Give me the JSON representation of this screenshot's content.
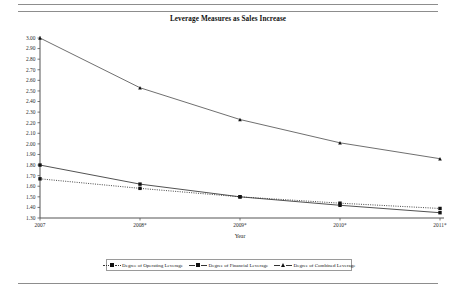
{
  "document": {
    "rules": [
      "top-rule-1",
      "top-rule-2",
      "bottom-rule"
    ]
  },
  "chart_data": {
    "type": "line",
    "title": "Leverage Measures as Sales Increase",
    "xlabel": "Year",
    "ylabel": "",
    "categories": [
      "2007",
      "2008*",
      "2009*",
      "2010*",
      "2011*"
    ],
    "ylim": [
      1.3,
      3.0
    ],
    "ytick_labels": [
      "3.00",
      "2.90",
      "2.80",
      "2.70",
      "2.60",
      "2.50",
      "2.40",
      "2.30",
      "2.20",
      "2.10",
      "2.00",
      "1.90",
      "1.80",
      "1.70",
      "1.60",
      "1.50",
      "1.40",
      "1.30"
    ],
    "ytick_values": [
      3.0,
      2.9,
      2.8,
      2.7,
      2.6,
      2.5,
      2.4,
      2.3,
      2.2,
      2.1,
      2.0,
      1.9,
      1.8,
      1.7,
      1.6,
      1.5,
      1.4,
      1.3
    ],
    "grid": false,
    "legend_position": "bottom",
    "series": [
      {
        "name": "Degree of Operating Leverage",
        "values": [
          1.67,
          1.58,
          1.5,
          1.44,
          1.39
        ],
        "line_style": "dotted",
        "marker": "square",
        "color": "#333333"
      },
      {
        "name": "Degree of Financial Leverage",
        "values": [
          1.8,
          1.62,
          1.5,
          1.42,
          1.35
        ],
        "line_style": "solid",
        "marker": "square",
        "color": "#333333"
      },
      {
        "name": "Degree of Combined Leverage",
        "values": [
          3.0,
          2.53,
          2.23,
          2.01,
          1.86
        ],
        "line_style": "solid",
        "marker": "triangle",
        "color": "#555555"
      }
    ]
  }
}
